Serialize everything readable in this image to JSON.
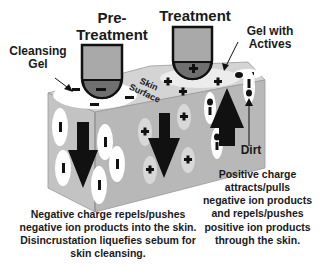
{
  "diagram": {
    "titles": {
      "pre_treatment_line1": "Pre-",
      "pre_treatment_line2": "Treatment",
      "treatment": "Treatment"
    },
    "labels": {
      "cleansing_gel_line1": "Cleansing",
      "cleansing_gel_line2": "Gel",
      "gel_actives_line1": "Gel with",
      "gel_actives_line2": "Actives",
      "skin_surface_line1": "Skin",
      "skin_surface_line2": "Surface",
      "dirt": "Dirt"
    },
    "electrodes": [
      {
        "name": "pre-treatment-electrode",
        "polarity": "-"
      },
      {
        "name": "treatment-electrode",
        "polarity": "+"
      }
    ],
    "captions": {
      "left": [
        "Negative charge repels/pushes",
        "negative ion products into the skin.",
        "Disincrustation liquefies sebum for",
        "skin cleansing."
      ],
      "right": [
        "Positive charge",
        "attracts/pulls",
        "negative ion products",
        "and repels/pushes",
        "positive ion products",
        "through the skin."
      ]
    },
    "colors": {
      "block_front": "#b9b9b9",
      "block_side": "#c8c8c8",
      "block_top": "#d6d6d6",
      "electrode_body": "#a8a8a8",
      "electrode_tip": "#6e6e6e",
      "ink": "#111111"
    }
  }
}
